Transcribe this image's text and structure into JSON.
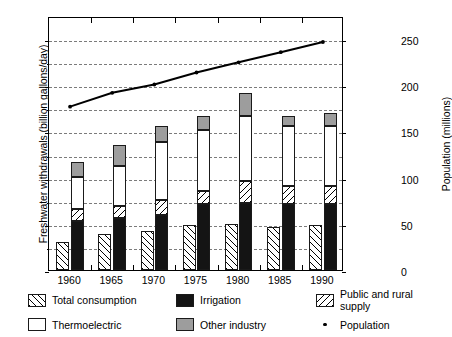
{
  "chart_data": {
    "type": "bar",
    "title": "",
    "subtitle": "",
    "categories": [
      "1960",
      "1965",
      "1970",
      "1975",
      "1980",
      "1985",
      "1990"
    ],
    "xlabel": "",
    "ylabel": "Freshwater withdrawals (billion gallons/day)",
    "ylabel_secondary": "Population (millions)",
    "ylim": [
      0,
      550
    ],
    "ylim_secondary": [
      0,
      275
    ],
    "yticks": [
      0,
      100,
      200,
      300,
      400,
      500
    ],
    "yticks_secondary": [
      0,
      50,
      100,
      150,
      200,
      250
    ],
    "gridlines": [
      50,
      100,
      150,
      200,
      250,
      300,
      350,
      400,
      450,
      500
    ],
    "grid": true,
    "legend_position": "below",
    "series": [
      {
        "name": "Total consumption",
        "kind": "bar",
        "group": "left",
        "fill": "forward-hatch",
        "values": [
          61,
          77,
          84,
          98,
          100,
          94,
          97
        ]
      },
      {
        "name": "Irrigation",
        "kind": "bar-stacked",
        "group": "right",
        "fill": "solid-black",
        "values": [
          107,
          113,
          120,
          143,
          146,
          143,
          143
        ]
      },
      {
        "name": "Public and rural supply",
        "kind": "bar-stacked",
        "group": "right",
        "fill": "back-hatch",
        "values": [
          25,
          25,
          31,
          29,
          46,
          40,
          39
        ]
      },
      {
        "name": "Thermoelectric",
        "kind": "bar-stacked",
        "group": "right",
        "fill": "white",
        "values": [
          70,
          87,
          127,
          131,
          142,
          129,
          129
        ]
      },
      {
        "name": "Other industry",
        "kind": "bar-stacked",
        "group": "right",
        "fill": "gray",
        "values": [
          31,
          45,
          33,
          30,
          49,
          22,
          29
        ]
      },
      {
        "name": "Population",
        "kind": "line",
        "axis": "secondary",
        "marker": "dot",
        "color": "#000000",
        "values": [
          179,
          194,
          203,
          216,
          227,
          238,
          249
        ]
      }
    ],
    "stack_totals": [
      233,
      270,
      311,
      333,
      383,
      334,
      340
    ],
    "legend": [
      {
        "label": "Total consumption",
        "swatch": "forward-hatch"
      },
      {
        "label": "Irrigation",
        "swatch": "solid-black"
      },
      {
        "label": "Public and rural supply",
        "swatch": "back-hatch"
      },
      {
        "label": "Thermoelectric",
        "swatch": "white"
      },
      {
        "label": "Other industry",
        "swatch": "gray"
      },
      {
        "label": "Population",
        "swatch": "dot"
      }
    ],
    "colors": {
      "irrigation": "#141414",
      "other_industry": "#9d9d9d",
      "thermoelectric": "#ffffff",
      "grid": "#7b7b7b",
      "axis": "#000000",
      "population_line": "#000000"
    }
  }
}
